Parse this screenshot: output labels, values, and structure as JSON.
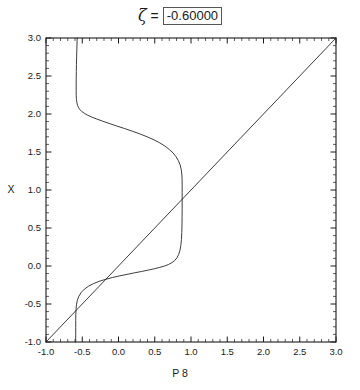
{
  "title": {
    "symbol": "ζ",
    "equals": "=",
    "value": "-0.60000"
  },
  "chart_data": {
    "type": "line",
    "title": "ζ = -0.60000",
    "xlabel": "P 8",
    "ylabel": "X",
    "xlim": [
      -1.0,
      3.0
    ],
    "ylim": [
      -1.0,
      3.0
    ],
    "grid": false,
    "legend": "none",
    "x_major_ticks": [
      -1.0,
      -0.5,
      0.0,
      0.5,
      1.0,
      1.5,
      2.0,
      2.5,
      3.0
    ],
    "y_major_ticks": [
      -1.0,
      -0.5,
      0.0,
      0.5,
      1.0,
      1.5,
      2.0,
      2.5,
      3.0
    ],
    "x_tick_labels": [
      "-1.0",
      "-0.5",
      "0.0",
      "0.5",
      "1.0",
      "1.5",
      "2.0",
      "2.5",
      "3.0"
    ],
    "y_tick_labels": [
      "-1.0",
      "-0.5",
      "0.0",
      "0.5",
      "1.0",
      "1.5",
      "2.0",
      "2.5",
      "3.0"
    ],
    "minor_tick_interval": 0.1,
    "series": [
      {
        "name": "identity-line",
        "description": "diagonal reference line y = x",
        "points": [
          [
            -1.0,
            -1.0
          ],
          [
            3.0,
            3.0
          ]
        ]
      },
      {
        "name": "map-curve",
        "description": "S-shaped multivalued map curve entering top edge, two vertical plateaus and two sigmoid transitions",
        "points": [
          [
            -0.57,
            3.0
          ],
          [
            -0.572,
            2.92
          ],
          [
            -0.575,
            2.83
          ],
          [
            -0.578,
            2.74
          ],
          [
            -0.58,
            2.65
          ],
          [
            -0.582,
            2.56
          ],
          [
            -0.583,
            2.47
          ],
          [
            -0.584,
            2.38
          ],
          [
            -0.584,
            2.3
          ],
          [
            -0.583,
            2.24
          ],
          [
            -0.58,
            2.19
          ],
          [
            -0.574,
            2.148
          ],
          [
            -0.564,
            2.112
          ],
          [
            -0.55,
            2.082
          ],
          [
            -0.53,
            2.056
          ],
          [
            -0.505,
            2.032
          ],
          [
            -0.47,
            2.008
          ],
          [
            -0.425,
            1.984
          ],
          [
            -0.37,
            1.96
          ],
          [
            -0.3,
            1.934
          ],
          [
            -0.22,
            1.906
          ],
          [
            -0.13,
            1.876
          ],
          [
            -0.03,
            1.844
          ],
          [
            0.08,
            1.81
          ],
          [
            0.19,
            1.774
          ],
          [
            0.3,
            1.736
          ],
          [
            0.4,
            1.698
          ],
          [
            0.49,
            1.66
          ],
          [
            0.57,
            1.62
          ],
          [
            0.64,
            1.578
          ],
          [
            0.7,
            1.534
          ],
          [
            0.752,
            1.488
          ],
          [
            0.794,
            1.438
          ],
          [
            0.826,
            1.386
          ],
          [
            0.85,
            1.33
          ],
          [
            0.865,
            1.272
          ],
          [
            0.873,
            1.21
          ],
          [
            0.877,
            1.14
          ],
          [
            0.878,
            1.06
          ],
          [
            0.878,
            0.97
          ],
          [
            0.878,
            0.87
          ],
          [
            0.878,
            0.76
          ],
          [
            0.877,
            0.65
          ],
          [
            0.876,
            0.54
          ],
          [
            0.873,
            0.44
          ],
          [
            0.868,
            0.35
          ],
          [
            0.86,
            0.272
          ],
          [
            0.848,
            0.206
          ],
          [
            0.83,
            0.152
          ],
          [
            0.806,
            0.108
          ],
          [
            0.775,
            0.072
          ],
          [
            0.736,
            0.044
          ],
          [
            0.69,
            0.02
          ],
          [
            0.636,
            0.0
          ],
          [
            0.57,
            -0.018
          ],
          [
            0.495,
            -0.036
          ],
          [
            0.41,
            -0.054
          ],
          [
            0.318,
            -0.072
          ],
          [
            0.22,
            -0.09
          ],
          [
            0.118,
            -0.11
          ],
          [
            0.015,
            -0.13
          ],
          [
            -0.085,
            -0.152
          ],
          [
            -0.18,
            -0.176
          ],
          [
            -0.268,
            -0.202
          ],
          [
            -0.346,
            -0.232
          ],
          [
            -0.414,
            -0.266
          ],
          [
            -0.47,
            -0.304
          ],
          [
            -0.514,
            -0.348
          ],
          [
            -0.547,
            -0.398
          ],
          [
            -0.568,
            -0.452
          ],
          [
            -0.58,
            -0.51
          ],
          [
            -0.586,
            -0.572
          ],
          [
            -0.589,
            -0.64
          ],
          [
            -0.59,
            -0.72
          ],
          [
            -0.59,
            -0.81
          ],
          [
            -0.59,
            -0.9
          ],
          [
            -0.59,
            -1.0
          ]
        ]
      }
    ]
  },
  "axes": {
    "x_label": "P 8",
    "y_label": "X"
  }
}
